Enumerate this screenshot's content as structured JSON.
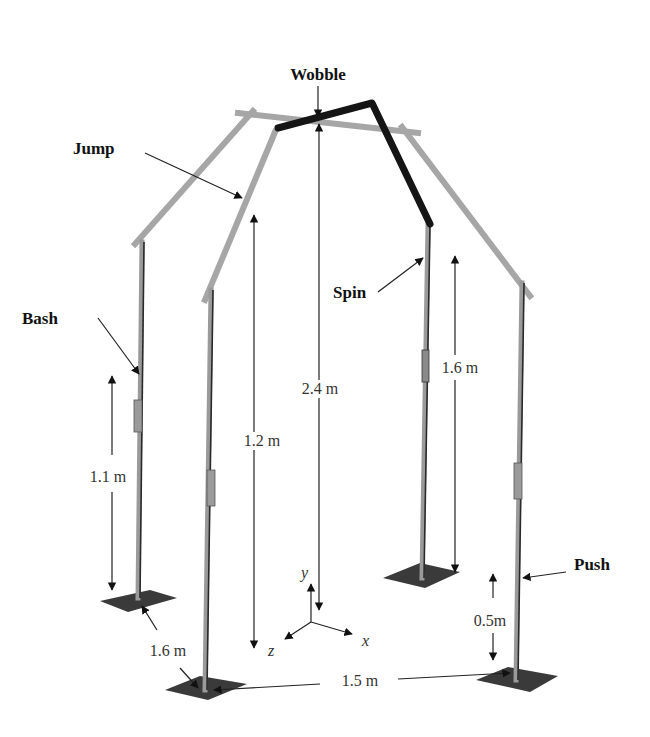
{
  "figure": {
    "type": "3D frame structure diagram (perturbation apparatus)",
    "background": "#ffffff",
    "colors": {
      "frame_light": "#a6a6a6",
      "frame_dark_wobble": "#151515",
      "base_plate": "#3a3a3a",
      "annotation": "#222222"
    }
  },
  "labels": {
    "wobble": "Wobble",
    "jump": "Jump",
    "bash": "Bash",
    "spin": "Spin",
    "push": "Push"
  },
  "dimensions": {
    "height_center": "2.4 m",
    "height_front_left_post": "1.2 m",
    "height_back_left_post": "1.1 m",
    "height_back_right_post": "1.6 m",
    "push_height": "0.5m",
    "depth_left": "1.6 m",
    "width_front": "1.5 m"
  },
  "axes": {
    "x": "x",
    "y": "y",
    "z": "z"
  }
}
